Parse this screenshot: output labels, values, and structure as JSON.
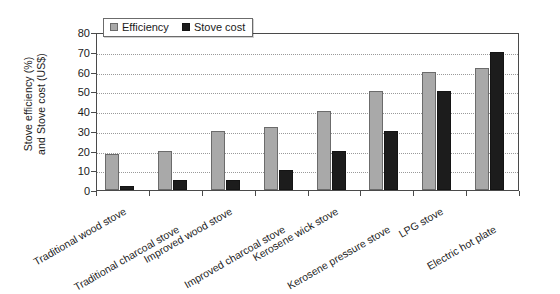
{
  "chart_data": {
    "type": "bar",
    "title": "",
    "subtitle": "",
    "xlabel": "",
    "ylabel_lines": [
      "Stove efficiency (%)",
      "and Stove cost (US$)"
    ],
    "ylabel": "Stove efficiency (%) and Stove cost (US$)",
    "ylim": [
      0,
      80
    ],
    "ytick_step": 10,
    "yticks": [
      0,
      10,
      20,
      30,
      40,
      50,
      60,
      70,
      80
    ],
    "ytick_labels": [
      "0",
      "10",
      "20",
      "30",
      "40",
      "50",
      "60",
      "70",
      "80"
    ],
    "grid": true,
    "grid_axis": "y",
    "grid_style": "dotted",
    "legend_position": "top-left-inside",
    "categories": [
      "Traditional wood stove",
      "Traditional charcoal stove",
      "Improved wood stove",
      "Improved charcoal stove",
      "Kerosene wick stove",
      "Kerosene pressure stove",
      "LPG stove",
      "Electric hot plate"
    ],
    "series": [
      {
        "name": "Efficiency",
        "unit": "%",
        "color": "#a9a9a9",
        "edge_color": "#6b6b6b",
        "values": [
          18,
          20,
          30,
          32,
          40,
          50,
          60,
          62
        ]
      },
      {
        "name": "Stove cost",
        "unit": "US$",
        "color": "#1c1c1c",
        "edge_color": "#141414",
        "values": [
          2,
          5,
          5,
          10,
          20,
          30,
          50,
          70
        ]
      }
    ]
  },
  "legend": {
    "entries": [
      {
        "label": "Efficiency",
        "swatch": "efficiency"
      },
      {
        "label": "Stove cost",
        "swatch": "cost"
      }
    ]
  },
  "axis": {
    "y_title_line1": "Stove efficiency (%)",
    "y_title_line2": "and Stove cost (US$)"
  },
  "colors": {
    "efficiency_fill": "#a9a9a9",
    "efficiency_edge": "#6b6b6b",
    "cost_fill": "#1c1c1c",
    "cost_edge": "#141414",
    "axis": "#4a4a4a",
    "grid": "#9a9a9a",
    "background": "#ffffff",
    "text": "#1a1a1a"
  }
}
